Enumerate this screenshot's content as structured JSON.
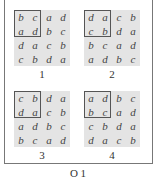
{
  "figure": {
    "caption": "O 1",
    "panels": [
      {
        "label": "1",
        "rows": [
          [
            "b",
            "c",
            "a",
            "d"
          ],
          [
            "a",
            "d",
            "b",
            "c"
          ],
          [
            "d",
            "a",
            "c",
            "b"
          ],
          [
            "c",
            "b",
            "d",
            "a"
          ]
        ],
        "highlight": "top-left 2x2"
      },
      {
        "label": "2",
        "rows": [
          [
            "d",
            "a",
            "c",
            "b"
          ],
          [
            "c",
            "b",
            "d",
            "a"
          ],
          [
            "b",
            "c",
            "a",
            "d"
          ],
          [
            "a",
            "d",
            "b",
            "c"
          ]
        ],
        "highlight": "top-left 2x2"
      },
      {
        "label": "3",
        "rows": [
          [
            "c",
            "b",
            "d",
            "a"
          ],
          [
            "d",
            "a",
            "c",
            "b"
          ],
          [
            "a",
            "d",
            "b",
            "c"
          ],
          [
            "b",
            "c",
            "a",
            "d"
          ]
        ],
        "highlight": "top-left 2x2"
      },
      {
        "label": "4",
        "rows": [
          [
            "a",
            "d",
            "b",
            "c"
          ],
          [
            "b",
            "c",
            "a",
            "d"
          ],
          [
            "c",
            "b",
            "d",
            "a"
          ],
          [
            "d",
            "a",
            "c",
            "b"
          ]
        ],
        "highlight": "top-left 2x2"
      }
    ]
  },
  "colors": {
    "cell_bg": "#e4e4e4",
    "frame": "#777777",
    "highlight_border": "#555555"
  }
}
